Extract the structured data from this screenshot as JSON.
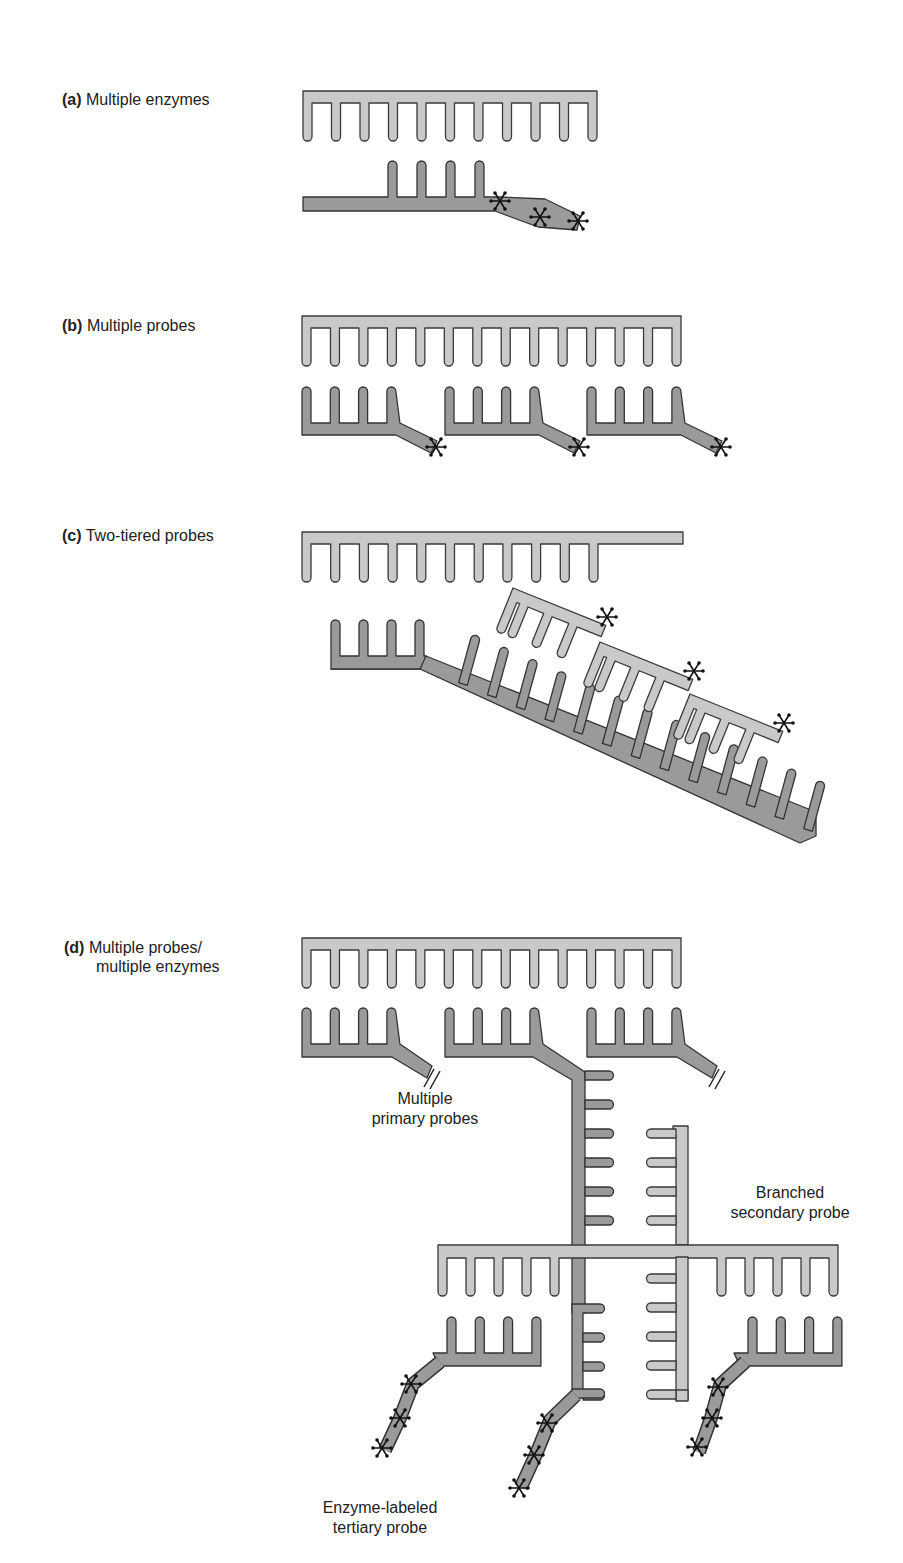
{
  "figure": {
    "panels": [
      {
        "id": "a",
        "letter": "(a)",
        "title": "Multiple enzymes"
      },
      {
        "id": "b",
        "letter": "(b)",
        "title": "Multiple probes"
      },
      {
        "id": "c",
        "letter": "(c)",
        "title": "Two-tiered probes"
      },
      {
        "id": "d",
        "letter": "(d)",
        "title": "Multiple probes/",
        "title_line2": "multiple enzymes"
      }
    ],
    "annotations": {
      "primary": {
        "line1": "Multiple",
        "line2": "primary probes"
      },
      "secondary": {
        "line1": "Branched",
        "line2": "secondary probe"
      },
      "tertiary": {
        "line1": "Enzyme-labeled",
        "line2": "tertiary probe"
      }
    },
    "colors": {
      "target_strand": "#c9c9c9",
      "probe_strand": "#9a9a9a",
      "outline": "#333333",
      "enzyme_label": "#111111"
    },
    "legend_symbols": {
      "enzyme": "asterisk-icon",
      "break": "double-slash-break-icon"
    },
    "structure": {
      "a": {
        "target_teeth": 11,
        "probe_teeth": 4,
        "enzymes": 3
      },
      "b": {
        "target_teeth": 14,
        "probes": 3,
        "probe_teeth": 4,
        "enzymes_per_probe": 1
      },
      "c": {
        "target_teeth": 11,
        "primary_teeth": 4,
        "primary_tail_teeth": 13,
        "secondary_probes": 3,
        "secondary_teeth": 3
      },
      "d": {
        "target_teeth": 14,
        "primary_probes": 3,
        "secondary_arms": 2,
        "tertiary_probes": 3,
        "enzymes_per_tertiary": 3
      }
    }
  }
}
